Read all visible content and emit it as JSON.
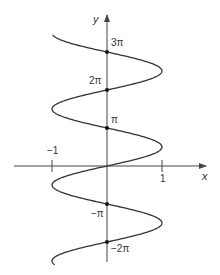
{
  "chart_data": {
    "type": "line",
    "title": "",
    "equation": "x = sin(y)",
    "xlabel": "x",
    "ylabel": "y",
    "x_ticks": [
      {
        "value": -1,
        "label": "−1"
      },
      {
        "value": 1,
        "label": "1"
      }
    ],
    "y_ticks": [
      {
        "value": 3.14159,
        "label": "π"
      },
      {
        "value": 6.28319,
        "label": "2π"
      },
      {
        "value": 9.42478,
        "label": "3π"
      },
      {
        "value": -3.14159,
        "label": "−π"
      },
      {
        "value": -6.28319,
        "label": "−2π"
      }
    ],
    "marked_points": [
      {
        "x": 0,
        "y": "3π"
      },
      {
        "x": 0,
        "y": "2π"
      },
      {
        "x": 0,
        "y": "π"
      },
      {
        "x": 0,
        "y": "−π"
      },
      {
        "x": 0,
        "y": "−2π"
      }
    ],
    "xlim": [
      -1,
      1
    ],
    "ylim": [
      -2.6,
      3.45
    ],
    "ylim_units": "multiples of π",
    "grid": false,
    "legend": "none",
    "series": [
      {
        "name": "x = sin y",
        "y_range_pi": [
          -2.6,
          3.45
        ],
        "color": "#333333"
      }
    ]
  },
  "colors": {
    "curve": "#333333",
    "axis": "#444444",
    "point": "#111111"
  }
}
